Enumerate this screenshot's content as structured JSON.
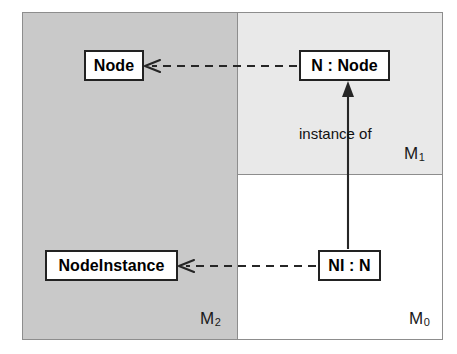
{
  "diagram": {
    "frame": {
      "border_color": "#8d8d8d"
    },
    "regions": [
      {
        "id": "m2",
        "label": "M",
        "subscript": "2",
        "fill": "#c9c9c9",
        "description": "Metamodel layer (left column, grey)"
      },
      {
        "id": "m1",
        "label": "M",
        "subscript": "1",
        "fill": "#e9e9e9",
        "description": "Model layer (upper right, light grey)"
      },
      {
        "id": "m0",
        "label": "M",
        "subscript": "0",
        "fill": "#ffffff",
        "description": "Instance layer (lower right, white)"
      }
    ],
    "boxes": [
      {
        "id": "node",
        "text": "Node",
        "region": "m2"
      },
      {
        "id": "n_node",
        "text": "N : Node",
        "region": "m1"
      },
      {
        "id": "nodeinstance",
        "text": "NodeInstance",
        "region": "m2"
      },
      {
        "id": "ni_n",
        "text": "NI : N",
        "region": "m0"
      }
    ],
    "edges": [
      {
        "id": "n-node-to-node",
        "from": "n_node",
        "to": "node",
        "style": "dashed",
        "arrowhead": "open",
        "label": ""
      },
      {
        "id": "ni-n-to-nodeinstance",
        "from": "ni_n",
        "to": "nodeinstance",
        "style": "dashed",
        "arrowhead": "open",
        "label": ""
      },
      {
        "id": "ni-n-to-n-node",
        "from": "ni_n",
        "to": "n_node",
        "style": "solid",
        "arrowhead": "filled",
        "label": "instance of"
      }
    ],
    "edge_labels": {
      "instance_of": "instance of"
    },
    "colors": {
      "stroke": "#222222",
      "divider": "#8d8d8d",
      "m2_fill": "#c9c9c9",
      "m1_fill": "#e9e9e9",
      "m0_fill": "#ffffff",
      "text": "#000000"
    }
  }
}
